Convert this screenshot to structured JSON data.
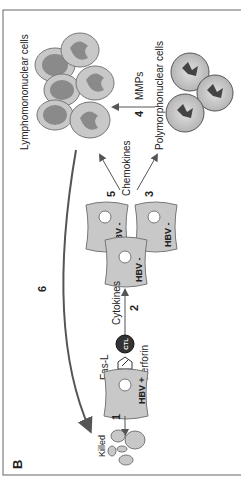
{
  "panel": {
    "letter": "B",
    "labels": {
      "lymphomononuclear": "Lymphomononuclear cells",
      "polymorphonuclear": "Polymorphonuclear cells",
      "mmps": "MMPs",
      "chemokines": "Chemokines",
      "cytokines": "Cytokines",
      "fas_l": "Fas-L",
      "perforin": "Perforin",
      "ctl": "CTL",
      "killed": "Killed",
      "hbv_pos": "HBV +",
      "hbv_neg_1": "HBV -",
      "hbv_neg_2": "HBV -",
      "hbv_neg_3": "HBV -"
    },
    "steps": {
      "s1": "1",
      "s2": "2",
      "s3": "3",
      "s4": "4",
      "s5": "5",
      "s6": "6"
    }
  },
  "colors": {
    "cell_fill": "#c8c8c8",
    "cell_stroke": "#777777",
    "nucleus_fill": "#8a8a8a",
    "ctl_fill": "#333333",
    "arrow": "#555555",
    "border": "#666666"
  }
}
